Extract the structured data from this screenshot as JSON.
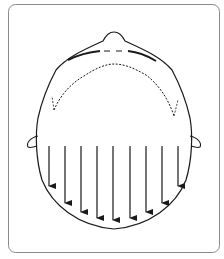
{
  "figure": {
    "frame": {
      "stroke": "#8a8a8a",
      "fill": "#ffffff"
    },
    "line_color": "#1a1a1a",
    "arrows": {
      "count": 9,
      "start_y": 146,
      "x": [
        49,
        65,
        81,
        97,
        113,
        130,
        146,
        162,
        178
      ],
      "end_y": [
        186,
        203,
        212,
        218,
        220,
        218,
        212,
        203,
        186
      ]
    }
  }
}
